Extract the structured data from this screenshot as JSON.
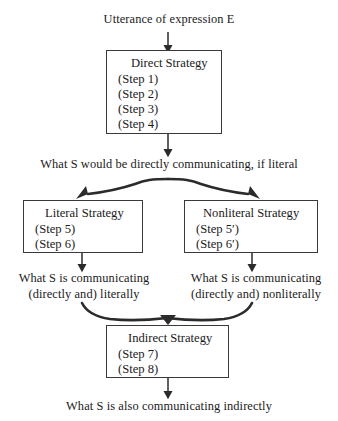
{
  "diagram": {
    "title": "Utterance of expression E",
    "theme": {
      "line_color": "#3a3a3a",
      "text_color": "#1a1a1a",
      "background": "#ffffff"
    },
    "nodes": {
      "utterance": {
        "label": "Utterance of expression E"
      },
      "direct_strategy": {
        "title": "Direct Strategy",
        "steps": [
          "(Step 1)",
          "(Step 2)",
          "(Step 3)",
          "(Step 4)"
        ]
      },
      "direct_output": {
        "label": "What S would be directly communicating, if literal"
      },
      "literal_strategy": {
        "title": "Literal Strategy",
        "steps": [
          "(Step 5)",
          "(Step 6)"
        ]
      },
      "nonliteral_strategy": {
        "title": "Nonliteral Strategy",
        "steps": [
          "(Step 5′)",
          "(Step 6′)"
        ]
      },
      "literal_output": {
        "line1": "What S is communicating",
        "line2": "(directly and) literally"
      },
      "nonliteral_output": {
        "line1": "What S is communicating",
        "line2": "(directly and) nonliterally"
      },
      "indirect_strategy": {
        "title": "Indirect Strategy",
        "steps": [
          "(Step 7)",
          "(Step 8)"
        ]
      },
      "indirect_output": {
        "label": "What S is also communicating indirectly"
      }
    }
  }
}
